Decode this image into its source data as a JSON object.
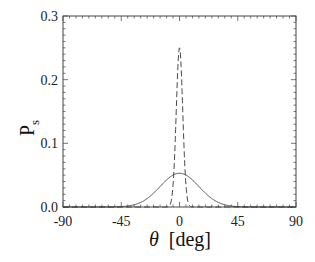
{
  "chart_data": {
    "type": "line",
    "title": "",
    "xlabel": "θ [deg]",
    "xlabel_symbol": "θ",
    "xlabel_unit": "[deg]",
    "ylabel": "P",
    "ylabel_sub": "s",
    "xlim": [
      -90,
      90
    ],
    "ylim": [
      0.0,
      0.3
    ],
    "xticks": [
      -90,
      -45,
      0,
      45,
      90
    ],
    "xtick_labels": [
      "-90",
      "-45",
      "0",
      "45",
      "90"
    ],
    "yticks": [
      0.0,
      0.1,
      0.2,
      0.3
    ],
    "ytick_labels": [
      "0.0",
      "0.1",
      "0.2",
      "0.3"
    ],
    "grid": false,
    "legend": null,
    "series": [
      {
        "name": "solid",
        "style": "solid",
        "type": "gaussian",
        "center": 0,
        "peak": 0.053,
        "sigma_deg": 15,
        "x": [
          -45,
          -30,
          -15,
          0,
          15,
          30,
          45
        ],
        "values": [
          0.001,
          0.009,
          0.032,
          0.053,
          0.032,
          0.009,
          0.001
        ]
      },
      {
        "name": "dashed",
        "style": "dashed",
        "type": "gaussian",
        "center": 0,
        "peak": 0.25,
        "sigma_deg": 2.5,
        "x": [
          -7.5,
          -5,
          -2.5,
          0,
          2.5,
          5,
          7.5
        ],
        "values": [
          0.003,
          0.034,
          0.152,
          0.25,
          0.152,
          0.034,
          0.003
        ]
      }
    ]
  }
}
